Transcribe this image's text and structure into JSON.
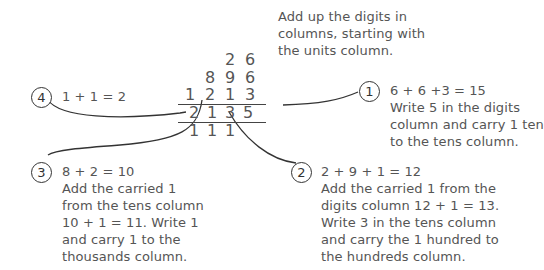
{
  "intro": {
    "lines": [
      "Add up the digits in",
      "columns, starting with",
      "the units column."
    ]
  },
  "sum": {
    "rows": [
      [
        "",
        "",
        "2",
        "6"
      ],
      [
        "",
        "8",
        "9",
        "6"
      ],
      [
        "1",
        "2",
        "1",
        "3"
      ]
    ],
    "result": [
      "2",
      "1",
      "3",
      "5"
    ],
    "carries": [
      "1",
      "1",
      "1",
      ""
    ]
  },
  "steps": [
    {
      "number": "1",
      "lines": [
        "6 + 6 +3 = 15",
        "Write 5 in the digits",
        "column and carry 1 ten",
        "to the tens column."
      ]
    },
    {
      "number": "2",
      "lines": [
        "2 + 9 + 1 = 12",
        "Add the carried 1 from the",
        "digits column 12 + 1 = 13.",
        "Write 3 in the tens column",
        "and carry the 1 hundred to",
        "the hundreds column."
      ]
    },
    {
      "number": "3",
      "lines": [
        "8 + 2 = 10",
        "Add the carried 1",
        "from the tens column",
        "10 + 1 = 11. Write 1",
        "and carry 1 to the",
        "thousands column."
      ]
    },
    {
      "number": "4",
      "lines": [
        "1 + 1 = 2"
      ]
    }
  ],
  "colors": {
    "line": "#333333",
    "text": "#555555"
  }
}
